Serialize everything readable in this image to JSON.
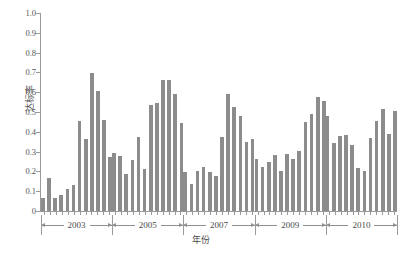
{
  "chart_data": {
    "type": "bar",
    "title": "",
    "subtitle": "",
    "xlabel": "年份",
    "ylabel": "达标率",
    "ylim": [
      0,
      1.0
    ],
    "ytick_labels": [
      "1.0",
      "0.9",
      "0.8",
      "0.7",
      "0.6",
      "0.5",
      "0.4",
      "0.3",
      "0.2",
      "0.1",
      "0"
    ],
    "ytick_values": [
      1.0,
      0.9,
      0.8,
      0.7,
      0.6,
      0.5,
      0.4,
      0.3,
      0.2,
      0.1,
      0
    ],
    "grid": false,
    "legend": null,
    "bar_color": "#8c8c8c",
    "axis_color": "#9a9a9a",
    "x_group_labels": [
      "2003",
      "2005",
      "2007",
      "2009",
      "2010"
    ],
    "groups": [
      {
        "label": "2003",
        "values": [
          0.065,
          0.165,
          0.065,
          0.083,
          0.112,
          0.13,
          0.455,
          0.365,
          0.695,
          0.605,
          0.458,
          0.272
        ]
      },
      {
        "label": "2005",
        "values": [
          0.295,
          0.278,
          0.188,
          0.257,
          0.372,
          0.213,
          0.537,
          0.547,
          0.66,
          0.66,
          0.59,
          0.442
        ]
      },
      {
        "label": "2007",
        "values": [
          0.197,
          0.135,
          0.2,
          0.22,
          0.199,
          0.177,
          0.372,
          0.59,
          0.525,
          0.48,
          0.347,
          0.362
        ]
      },
      {
        "label": "2009",
        "values": [
          0.262,
          0.22,
          0.25,
          0.285,
          0.204,
          0.29,
          0.263,
          0.301,
          0.448,
          0.492,
          0.575,
          0.558
        ]
      },
      {
        "label": "2010",
        "values": [
          0.48,
          0.341,
          0.38,
          0.383,
          0.333,
          0.216,
          0.204,
          0.367,
          0.455,
          0.516,
          0.39,
          0.503
        ]
      }
    ],
    "values_flat": [
      0.065,
      0.165,
      0.065,
      0.083,
      0.112,
      0.13,
      0.455,
      0.365,
      0.695,
      0.605,
      0.458,
      0.272,
      0.295,
      0.278,
      0.188,
      0.257,
      0.372,
      0.213,
      0.537,
      0.547,
      0.66,
      0.66,
      0.59,
      0.442,
      0.197,
      0.135,
      0.2,
      0.22,
      0.199,
      0.177,
      0.372,
      0.59,
      0.525,
      0.48,
      0.347,
      0.362,
      0.262,
      0.22,
      0.25,
      0.285,
      0.204,
      0.29,
      0.263,
      0.301,
      0.448,
      0.492,
      0.575,
      0.558,
      0.48,
      0.341,
      0.38,
      0.383,
      0.333,
      0.216,
      0.204,
      0.367,
      0.455,
      0.516,
      0.39,
      0.503
    ]
  }
}
